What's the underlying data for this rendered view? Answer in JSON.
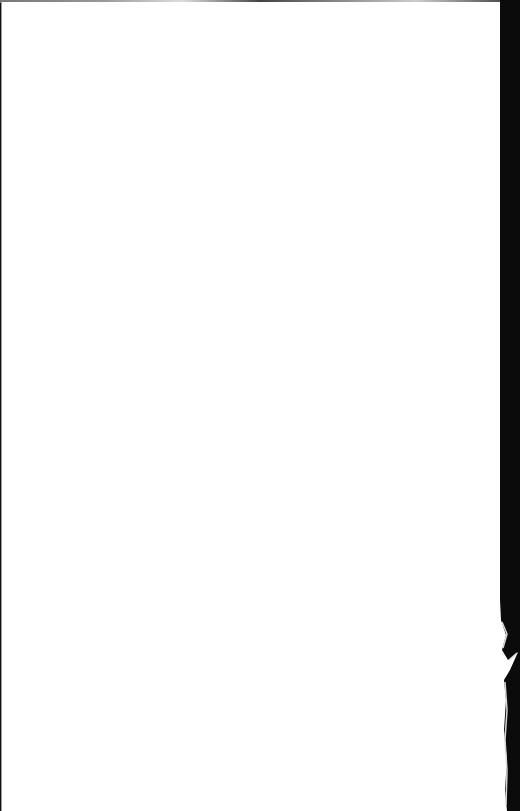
{
  "document": {
    "type": "scanned-page",
    "content": "",
    "colors": {
      "paper": "#ffffff",
      "background": "#111111",
      "border": "#9a9a9a"
    }
  }
}
